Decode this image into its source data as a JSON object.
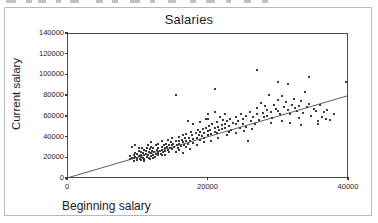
{
  "figure": {
    "title": "Salaries",
    "background_color": "#ffffff",
    "frame_color": "#b9b9b9",
    "axis_color": "#4a4a4a"
  },
  "chart_data": {
    "type": "scatter",
    "title": "Salaries",
    "xlabel": "Beginning salary",
    "ylabel": "Current salary",
    "xlim": [
      0,
      40000
    ],
    "ylim": [
      0,
      140000
    ],
    "xticks": [
      0,
      20000,
      40000
    ],
    "xtick_labels": [
      "0",
      "20000",
      "40000"
    ],
    "yticks": [
      0,
      20000,
      40000,
      60000,
      80000,
      100000,
      120000,
      140000
    ],
    "ytick_labels": [
      "0",
      "20000",
      "40000",
      "60000",
      "80000",
      "100000",
      "120000",
      "140000"
    ],
    "grid": false,
    "legend": false,
    "marker_color": "#3a3a3a",
    "marker_size": 2,
    "fit_line": {
      "label": "linear fit",
      "color": "#4a4a4a",
      "x": [
        0,
        40000
      ],
      "y": [
        0,
        79500
      ]
    },
    "points": [
      [
        9000,
        18750
      ],
      [
        9000,
        21000
      ],
      [
        9200,
        30000
      ],
      [
        9200,
        19500
      ],
      [
        9500,
        16500
      ],
      [
        9500,
        22500
      ],
      [
        9600,
        19000
      ],
      [
        9750,
        24000
      ],
      [
        9750,
        20250
      ],
      [
        9900,
        17250
      ],
      [
        10000,
        23250
      ],
      [
        10000,
        19500
      ],
      [
        10200,
        26250
      ],
      [
        10200,
        21000
      ],
      [
        10350,
        18000
      ],
      [
        10500,
        25500
      ],
      [
        10500,
        22500
      ],
      [
        10500,
        20250
      ],
      [
        10650,
        28500
      ],
      [
        10800,
        19500
      ],
      [
        10800,
        24000
      ],
      [
        11000,
        21750
      ],
      [
        11000,
        27000
      ],
      [
        11000,
        18750
      ],
      [
        11250,
        23250
      ],
      [
        11250,
        26250
      ],
      [
        11400,
        20250
      ],
      [
        11400,
        29250
      ],
      [
        11550,
        22500
      ],
      [
        11700,
        25500
      ],
      [
        11700,
        19500
      ],
      [
        11850,
        27750
      ],
      [
        12000,
        24000
      ],
      [
        12000,
        21000
      ],
      [
        12000,
        30000
      ],
      [
        12150,
        26250
      ],
      [
        12300,
        22500
      ],
      [
        12300,
        28500
      ],
      [
        12450,
        25500
      ],
      [
        12600,
        23250
      ],
      [
        12600,
        31500
      ],
      [
        12750,
        27000
      ],
      [
        12900,
        24750
      ],
      [
        12900,
        21750
      ],
      [
        13000,
        29250
      ],
      [
        13000,
        33000
      ],
      [
        13200,
        26250
      ],
      [
        13350,
        23250
      ],
      [
        13500,
        30000
      ],
      [
        13500,
        27000
      ],
      [
        13500,
        35250
      ],
      [
        13650,
        24750
      ],
      [
        13800,
        31500
      ],
      [
        13950,
        28500
      ],
      [
        14000,
        26250
      ],
      [
        14100,
        33000
      ],
      [
        14250,
        30000
      ],
      [
        14400,
        27000
      ],
      [
        14400,
        36750
      ],
      [
        14550,
        32250
      ],
      [
        14700,
        29250
      ],
      [
        14850,
        34500
      ],
      [
        15000,
        31500
      ],
      [
        15000,
        27750
      ],
      [
        15000,
        38250
      ],
      [
        15150,
        33000
      ],
      [
        15300,
        30000
      ],
      [
        15450,
        36000
      ],
      [
        15500,
        80000
      ],
      [
        15600,
        32250
      ],
      [
        15750,
        29250
      ],
      [
        15900,
        35250
      ],
      [
        16000,
        33000
      ],
      [
        16000,
        39750
      ],
      [
        16200,
        30750
      ],
      [
        16350,
        36750
      ],
      [
        16500,
        34500
      ],
      [
        16500,
        41250
      ],
      [
        16650,
        31500
      ],
      [
        16800,
        38250
      ],
      [
        17000,
        35250
      ],
      [
        17000,
        42750
      ],
      [
        17250,
        33000
      ],
      [
        17250,
        55500
      ],
      [
        17400,
        39000
      ],
      [
        17550,
        36000
      ],
      [
        17700,
        44250
      ],
      [
        17850,
        41250
      ],
      [
        18000,
        37500
      ],
      [
        18000,
        33750
      ],
      [
        18000,
        52500
      ],
      [
        18300,
        43500
      ],
      [
        18450,
        39000
      ],
      [
        18600,
        46500
      ],
      [
        18750,
        41250
      ],
      [
        18900,
        36750
      ],
      [
        19000,
        44250
      ],
      [
        19000,
        54000
      ],
      [
        19200,
        40500
      ],
      [
        19350,
        47250
      ],
      [
        19500,
        43500
      ],
      [
        19500,
        38250
      ],
      [
        19800,
        48750
      ],
      [
        20000,
        45000
      ],
      [
        20000,
        41250
      ],
      [
        20000,
        57000
      ],
      [
        20250,
        50250
      ],
      [
        20400,
        46500
      ],
      [
        20550,
        42750
      ],
      [
        20700,
        52500
      ],
      [
        21000,
        48000
      ],
      [
        21000,
        44250
      ],
      [
        21000,
        63750
      ],
      [
        21000,
        85500
      ],
      [
        21300,
        54000
      ],
      [
        21450,
        49500
      ],
      [
        21600,
        46500
      ],
      [
        21750,
        58500
      ],
      [
        22000,
        51000
      ],
      [
        22000,
        47250
      ],
      [
        22200,
        56250
      ],
      [
        22500,
        52500
      ],
      [
        22500,
        48000
      ],
      [
        22500,
        61500
      ],
      [
        22800,
        54750
      ],
      [
        23000,
        50250
      ],
      [
        23250,
        57000
      ],
      [
        23400,
        46500
      ],
      [
        23700,
        53250
      ],
      [
        24000,
        59250
      ],
      [
        24000,
        51750
      ],
      [
        24300,
        55500
      ],
      [
        24600,
        48750
      ],
      [
        24750,
        62250
      ],
      [
        25000,
        57000
      ],
      [
        25000,
        52500
      ],
      [
        25500,
        60000
      ],
      [
        25500,
        49500
      ],
      [
        25800,
        35250
      ],
      [
        26000,
        63750
      ],
      [
        26250,
        55500
      ],
      [
        26500,
        58500
      ],
      [
        26700,
        52500
      ],
      [
        27000,
        67500
      ],
      [
        27000,
        61500
      ],
      [
        27000,
        104250
      ],
      [
        27300,
        56250
      ],
      [
        27600,
        72750
      ],
      [
        27900,
        63000
      ],
      [
        28000,
        58500
      ],
      [
        28200,
        69750
      ],
      [
        28500,
        66000
      ],
      [
        28500,
        60000
      ],
      [
        28800,
        80250
      ],
      [
        29000,
        63750
      ],
      [
        29250,
        57750
      ],
      [
        29500,
        70500
      ],
      [
        29700,
        66750
      ],
      [
        30000,
        92250
      ],
      [
        30000,
        75000
      ],
      [
        30000,
        64500
      ],
      [
        30300,
        61500
      ],
      [
        30600,
        79500
      ],
      [
        30900,
        68250
      ],
      [
        31200,
        73500
      ],
      [
        31500,
        66000
      ],
      [
        31500,
        90750
      ],
      [
        31800,
        62250
      ],
      [
        32000,
        70500
      ],
      [
        32250,
        76500
      ],
      [
        32400,
        67500
      ],
      [
        32700,
        64500
      ],
      [
        33000,
        69750
      ],
      [
        33000,
        57750
      ],
      [
        33300,
        74250
      ],
      [
        33600,
        63000
      ],
      [
        33900,
        83250
      ],
      [
        34200,
        68250
      ],
      [
        34500,
        71250
      ],
      [
        34500,
        97500
      ],
      [
        34800,
        60000
      ],
      [
        35100,
        66750
      ],
      [
        35400,
        64500
      ],
      [
        35700,
        55500
      ],
      [
        36000,
        70500
      ],
      [
        36300,
        58500
      ],
      [
        36600,
        63750
      ],
      [
        37000,
        65250
      ],
      [
        37500,
        56250
      ],
      [
        38000,
        61500
      ],
      [
        39750,
        92250
      ],
      [
        12000,
        34500
      ],
      [
        11500,
        31500
      ],
      [
        13000,
        24000
      ],
      [
        14000,
        22500
      ],
      [
        12500,
        20250
      ],
      [
        15500,
        24750
      ],
      [
        16000,
        27000
      ],
      [
        17000,
        30000
      ],
      [
        18500,
        32250
      ],
      [
        19500,
        34500
      ],
      [
        20500,
        36000
      ],
      [
        13500,
        22500
      ],
      [
        14500,
        25500
      ],
      [
        10500,
        17250
      ],
      [
        11000,
        16500
      ],
      [
        11750,
        18000
      ],
      [
        12250,
        19500
      ],
      [
        9750,
        31500
      ],
      [
        10250,
        28500
      ],
      [
        16500,
        24000
      ],
      [
        17500,
        27750
      ],
      [
        21500,
        39000
      ],
      [
        22800,
        41250
      ],
      [
        24000,
        43500
      ],
      [
        25200,
        45750
      ],
      [
        20100,
        61500
      ],
      [
        19800,
        57000
      ],
      [
        21300,
        43500
      ],
      [
        23100,
        44250
      ],
      [
        26400,
        47250
      ],
      [
        29100,
        53250
      ],
      [
        30600,
        55500
      ],
      [
        31800,
        53250
      ],
      [
        33300,
        51000
      ],
      [
        35700,
        52500
      ],
      [
        36900,
        57000
      ]
    ]
  }
}
